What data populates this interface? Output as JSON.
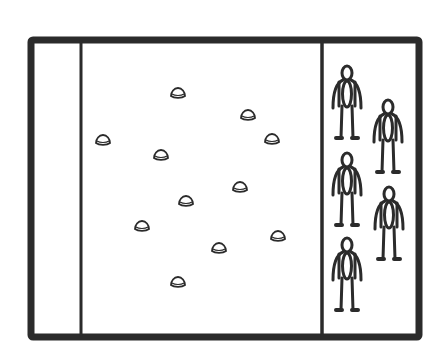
{
  "diagram": {
    "type": "sports-field-drill-layout",
    "colors": {
      "line": "#2b2b2b",
      "background": "#ffffff",
      "cone_fill": "#ffffff"
    },
    "field": {
      "left": 31,
      "top": 40,
      "right": 419,
      "bottom": 337
    },
    "end_zone_line_x": 81,
    "waiting_area_line_x": 322,
    "cones": [
      {
        "x": 178,
        "y": 93
      },
      {
        "x": 248,
        "y": 115
      },
      {
        "x": 103,
        "y": 140
      },
      {
        "x": 272,
        "y": 139
      },
      {
        "x": 161,
        "y": 155
      },
      {
        "x": 240,
        "y": 187
      },
      {
        "x": 186,
        "y": 201
      },
      {
        "x": 142,
        "y": 226
      },
      {
        "x": 278,
        "y": 236
      },
      {
        "x": 219,
        "y": 248
      },
      {
        "x": 178,
        "y": 282
      }
    ],
    "players": [
      {
        "x": 347,
        "y": 74
      },
      {
        "x": 388,
        "y": 108
      },
      {
        "x": 347,
        "y": 161
      },
      {
        "x": 389,
        "y": 195
      },
      {
        "x": 347,
        "y": 246
      }
    ]
  }
}
